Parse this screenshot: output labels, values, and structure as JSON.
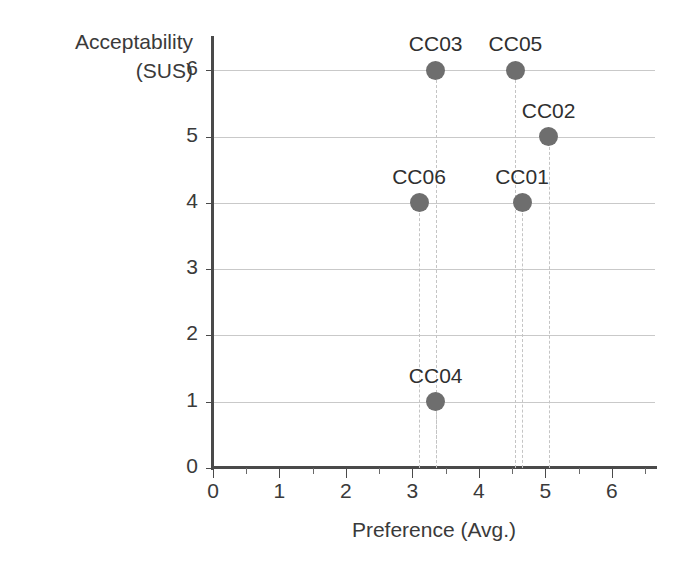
{
  "chart_data": {
    "type": "scatter",
    "title": "",
    "xlabel": "Preference (Avg.)",
    "ylabel": "Acceptability\n(SUS)",
    "xlim": [
      0,
      6.65
    ],
    "ylim": [
      0,
      6.2
    ],
    "xticks": [
      0,
      1,
      2,
      3,
      4,
      5,
      6
    ],
    "xtick_labels": [
      "0",
      "1",
      "2",
      "3",
      "4",
      "5",
      "6"
    ],
    "x_minor_ticks": [
      0.5,
      1.5,
      2.5,
      3.5,
      4.5,
      5.5,
      6.5
    ],
    "yticks": [
      0,
      1,
      2,
      3,
      4,
      5,
      6
    ],
    "ytick_labels": [
      "0",
      "1",
      "2",
      "3",
      "4",
      "5",
      "6"
    ],
    "grid": "horizontal",
    "legend": "none",
    "marker_color": "#6e6e6e",
    "gridline_color": "#c9c9c9",
    "dropline_color": "#c4c4c4",
    "axis_color": "#4a4a4a",
    "points": [
      {
        "label": "CC03",
        "x": 3.35,
        "y": 6
      },
      {
        "label": "CC05",
        "x": 4.55,
        "y": 6
      },
      {
        "label": "CC02",
        "x": 5.05,
        "y": 5
      },
      {
        "label": "CC06",
        "x": 3.1,
        "y": 4
      },
      {
        "label": "CC01",
        "x": 4.65,
        "y": 4
      },
      {
        "label": "CC04",
        "x": 3.35,
        "y": 1
      }
    ]
  }
}
